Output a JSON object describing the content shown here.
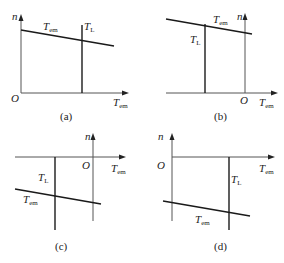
{
  "figure": {
    "panels": [
      {
        "id": "a",
        "caption": "(a)",
        "y_axis_label": "n",
        "x_axis_label": "T",
        "x_axis_label_sub": "em",
        "origin_label": "O",
        "curve_label": "T",
        "curve_label_sub": "em",
        "load_label": "T",
        "load_label_sub": "L",
        "quadrant": "I"
      },
      {
        "id": "b",
        "caption": "(b)",
        "y_axis_label": "n",
        "x_axis_label": "T",
        "x_axis_label_sub": "em",
        "origin_label": "O",
        "curve_label": "T",
        "curve_label_sub": "em",
        "load_label": "T",
        "load_label_sub": "L",
        "quadrant": "II"
      },
      {
        "id": "c",
        "caption": "(c)",
        "y_axis_label": "n",
        "x_axis_label": "T",
        "x_axis_label_sub": "em",
        "origin_label": "O",
        "curve_label": "T",
        "curve_label_sub": "em",
        "load_label": "T",
        "load_label_sub": "L",
        "quadrant": "III"
      },
      {
        "id": "d",
        "caption": "(d)",
        "y_axis_label": "n",
        "x_axis_label": "T",
        "x_axis_label_sub": "em",
        "origin_label": "O",
        "curve_label": "T",
        "curve_label_sub": "em",
        "load_label": "T",
        "load_label_sub": "L",
        "quadrant": "IV"
      }
    ],
    "colors": {
      "line": "#1a1a1a",
      "axis": "#555555",
      "background": "#ffffff"
    }
  }
}
